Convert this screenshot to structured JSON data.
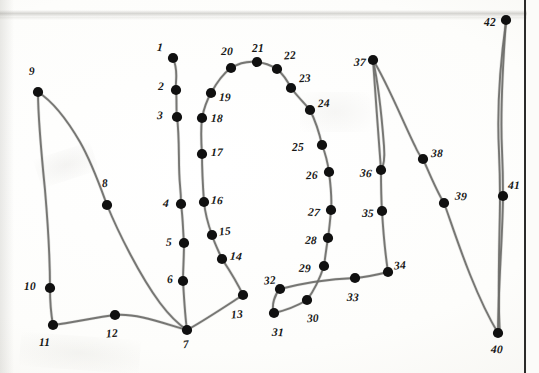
{
  "document": {
    "kind": "connect-the-dots-worksheet-scan",
    "title": "Connect the Dots",
    "background_color": "#fdfdfb",
    "ink_color": "#6c6c69",
    "dot_color": "#101010",
    "label_color": "#171716",
    "margin_rule_color": "#2b2b2a"
  },
  "dots": [
    {
      "n": "1",
      "x": 173,
      "y": 58,
      "lx": 157,
      "ly": 42
    },
    {
      "n": "2",
      "x": 176,
      "y": 90,
      "lx": 158,
      "ly": 81
    },
    {
      "n": "3",
      "x": 177,
      "y": 117,
      "lx": 157,
      "ly": 110
    },
    {
      "n": "4",
      "x": 181,
      "y": 204,
      "lx": 163,
      "ly": 198
    },
    {
      "n": "5",
      "x": 184,
      "y": 243,
      "lx": 166,
      "ly": 237
    },
    {
      "n": "6",
      "x": 183,
      "y": 281,
      "lx": 167,
      "ly": 274
    },
    {
      "n": "7",
      "x": 187,
      "y": 330,
      "lx": 183,
      "ly": 339
    },
    {
      "n": "8",
      "x": 107,
      "y": 205,
      "lx": 102,
      "ly": 178
    },
    {
      "n": "9",
      "x": 38,
      "y": 92,
      "lx": 29,
      "ly": 66
    },
    {
      "n": "10",
      "x": 50,
      "y": 288,
      "lx": 24,
      "ly": 281
    },
    {
      "n": "11",
      "x": 53,
      "y": 325,
      "lx": 39,
      "ly": 337
    },
    {
      "n": "12",
      "x": 115,
      "y": 315,
      "lx": 106,
      "ly": 328
    },
    {
      "n": "13",
      "x": 243,
      "y": 295,
      "lx": 231,
      "ly": 309
    },
    {
      "n": "14",
      "x": 222,
      "y": 259,
      "lx": 230,
      "ly": 251
    },
    {
      "n": "15",
      "x": 212,
      "y": 235,
      "lx": 219,
      "ly": 226
    },
    {
      "n": "16",
      "x": 204,
      "y": 202,
      "lx": 211,
      "ly": 195
    },
    {
      "n": "17",
      "x": 202,
      "y": 154,
      "lx": 211,
      "ly": 147
    },
    {
      "n": "18",
      "x": 202,
      "y": 118,
      "lx": 211,
      "ly": 113
    },
    {
      "n": "19",
      "x": 211,
      "y": 93,
      "lx": 219,
      "ly": 92
    },
    {
      "n": "20",
      "x": 231,
      "y": 68,
      "lx": 221,
      "ly": 46
    },
    {
      "n": "21",
      "x": 257,
      "y": 62,
      "lx": 252,
      "ly": 43
    },
    {
      "n": "22",
      "x": 277,
      "y": 69,
      "lx": 284,
      "ly": 50
    },
    {
      "n": "23",
      "x": 291,
      "y": 88,
      "lx": 299,
      "ly": 73
    },
    {
      "n": "24",
      "x": 310,
      "y": 110,
      "lx": 318,
      "ly": 98
    },
    {
      "n": "25",
      "x": 322,
      "y": 145,
      "lx": 292,
      "ly": 142
    },
    {
      "n": "26",
      "x": 329,
      "y": 172,
      "lx": 306,
      "ly": 170
    },
    {
      "n": "27",
      "x": 331,
      "y": 210,
      "lx": 308,
      "ly": 207
    },
    {
      "n": "28",
      "x": 328,
      "y": 238,
      "lx": 305,
      "ly": 235
    },
    {
      "n": "29",
      "x": 324,
      "y": 266,
      "lx": 299,
      "ly": 263
    },
    {
      "n": "30",
      "x": 307,
      "y": 300,
      "lx": 307,
      "ly": 313
    },
    {
      "n": "31",
      "x": 274,
      "y": 313,
      "lx": 272,
      "ly": 327
    },
    {
      "n": "32",
      "x": 280,
      "y": 289,
      "lx": 264,
      "ly": 275
    },
    {
      "n": "33",
      "x": 355,
      "y": 278,
      "lx": 347,
      "ly": 292
    },
    {
      "n": "34",
      "x": 388,
      "y": 272,
      "lx": 394,
      "ly": 260
    },
    {
      "n": "35",
      "x": 382,
      "y": 211,
      "lx": 362,
      "ly": 208
    },
    {
      "n": "36",
      "x": 381,
      "y": 170,
      "lx": 360,
      "ly": 168
    },
    {
      "n": "37",
      "x": 373,
      "y": 60,
      "lx": 354,
      "ly": 57
    },
    {
      "n": "38",
      "x": 423,
      "y": 159,
      "lx": 431,
      "ly": 148
    },
    {
      "n": "39",
      "x": 444,
      "y": 203,
      "lx": 455,
      "ly": 191
    },
    {
      "n": "40",
      "x": 498,
      "y": 333,
      "lx": 491,
      "ly": 344
    },
    {
      "n": "41",
      "x": 503,
      "y": 196,
      "lx": 508,
      "ly": 180
    },
    {
      "n": "42",
      "x": 506,
      "y": 20,
      "lx": 484,
      "ly": 17
    }
  ],
  "strokes": [
    {
      "id": "stroke-1-7",
      "label": "left-inner-vertical-1-to-7",
      "d": "M173,58 C179,72 175,80 176,90 C177,100 176,110 177,117 C180,140 178,165 180,185 C181,195 181,199 181,204 C183,218 183,232 184,243 C184,258 183,270 183,281 C184,298 185,316 187,330"
    },
    {
      "id": "stroke-9-8-7",
      "label": "diagonal-9-to-8-to-7",
      "d": "M38,92 C52,101 66,118 80,142 C92,163 100,186 107,205 C118,232 140,276 160,303 C172,319 181,326 187,330"
    },
    {
      "id": "stroke-9-10-11",
      "label": "left-outer-9-to-10-to-11",
      "d": "M38,92 C38,112 41,150 45,190 C48,225 50,262 50,288 C50,302 51,314 53,325"
    },
    {
      "id": "stroke-11-12-7",
      "label": "bottom-11-to-12-to-7",
      "d": "M53,325 C72,323 96,317 115,315 C138,313 165,324 187,330"
    },
    {
      "id": "stroke-7-13",
      "label": "bottom-right-7-to-13",
      "d": "M187,330 C202,322 226,306 243,295"
    },
    {
      "id": "stroke-13-17",
      "label": "right-inner-13-to-14-15-16-17",
      "d": "M243,295 C236,280 228,268 222,259 C218,250 214,242 212,235 C208,224 205,212 204,202 C203,188 202,168 202,154"
    },
    {
      "id": "stroke-17-21",
      "label": "arch-left-17-18-19-20-21",
      "d": "M202,154 C201,140 201,127 202,118 C204,108 207,100 211,93 C217,82 224,73 231,68 C239,63 249,61 257,62"
    },
    {
      "id": "stroke-21-29",
      "label": "arch-right-21-22-23-24-25-26-27-28-29",
      "d": "M257,62 C266,63 272,66 277,69 C284,75 288,82 291,88 C298,97 305,104 310,110 C317,124 320,136 322,145 C326,155 328,165 329,172 C331,188 332,201 331,210 C330,222 329,231 328,238 C326,250 325,259 324,266 C320,278 313,292 307,300"
    },
    {
      "id": "stroke-29-31",
      "label": "loop-29-to-30-to-31",
      "d": "M307,300 C297,306 283,311 274,313"
    },
    {
      "id": "stroke-31-32",
      "label": "loop-31-to-32",
      "d": "M274,313 C271,305 275,294 280,289"
    },
    {
      "id": "stroke-32-34",
      "label": "crossbar-32-33-34",
      "d": "M280,289 C303,283 332,279 355,278 C368,277 380,274 388,272"
    },
    {
      "id": "stroke-34-37",
      "label": "right-figure-34-35-36-37",
      "d": "M388,272 C385,252 383,228 382,211 C381,196 381,180 381,170 C379,142 375,90 373,60"
    },
    {
      "id": "stroke-37-36b",
      "label": "right-figure-inner-37-to-36",
      "d": "M373,60 C378,82 382,120 384,146 C385,160 384,166 381,170"
    },
    {
      "id": "stroke-37-38-39-40",
      "label": "long-sweep-37-38-39-40",
      "d": "M373,60 C386,80 404,124 415,146 C418,153 421,157 423,159 C428,170 436,190 444,203 C452,224 472,290 498,333"
    },
    {
      "id": "stroke-42-41-40",
      "label": "right-column-42-41-40",
      "d": "M506,20 C503,62 500,110 502,150 C503,172 503,186 503,196 C503,230 498,290 498,333"
    },
    {
      "id": "stroke-42-41-40-b",
      "label": "right-column-inner-42-41-40",
      "d": "M506,22 C500,64 497,112 499,152 C500,174 500,188 500,198 C500,232 497,292 500,334"
    }
  ],
  "margin_rule": {
    "label": "right-margin-rule",
    "x": 524
  }
}
